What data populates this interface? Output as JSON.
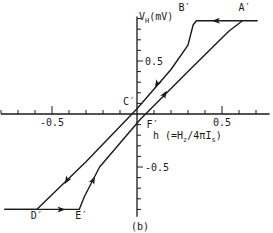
{
  "chart_data": {
    "type": "line",
    "title": "",
    "panel_label": "(b)",
    "xlabel": "h (=Hz/4πIs)",
    "xlabel_parts": {
      "main": "h (=H",
      "sub1": "z",
      "mid": "/4πI",
      "sub2": "s",
      "end": ")"
    },
    "ylabel": "VH(mV)",
    "ylabel_parts": {
      "main": "V",
      "sub": "H",
      "end": "(mV)"
    },
    "xlim": [
      -0.8,
      0.78
    ],
    "ylim": [
      -0.97,
      0.92
    ],
    "x_ticks_major": [
      -0.5,
      0.5
    ],
    "x_tick_labels": [
      "-0.5",
      "0.5"
    ],
    "x_tick_step": 0.1,
    "y_ticks_major": [
      0.5,
      -0.5
    ],
    "y_tick_labels": [
      "0.5",
      "-0.5"
    ],
    "y_tick_step": 0.1,
    "grid": false,
    "point_labels": [
      {
        "name": "A′",
        "x": 0.62,
        "y": 0.88
      },
      {
        "name": "B′",
        "x": 0.35,
        "y": 0.88
      },
      {
        "name": "C′",
        "x": 0.0,
        "y": 0.05
      },
      {
        "name": "D′",
        "x": -0.59,
        "y": -0.9
      },
      {
        "name": "E′",
        "x": -0.34,
        "y": -0.9
      },
      {
        "name": "F′",
        "x": 0.02,
        "y": -0.04
      }
    ],
    "series": [
      {
        "name": "descending branch (A′→B′→C′→D′)",
        "points": [
          [
            0.71,
            0.88
          ],
          [
            0.35,
            0.88
          ],
          [
            0.33,
            0.84
          ],
          [
            0.3,
            0.65
          ],
          [
            0.2,
            0.42
          ],
          [
            0.0,
            0.05
          ],
          [
            -0.3,
            -0.45
          ],
          [
            -0.59,
            -0.9
          ],
          [
            -0.78,
            -0.9
          ]
        ]
      },
      {
        "name": "ascending branch (D′→E′→F′→A′)",
        "points": [
          [
            -0.78,
            -0.9
          ],
          [
            -0.34,
            -0.9
          ],
          [
            -0.31,
            -0.78
          ],
          [
            -0.22,
            -0.5
          ],
          [
            0.02,
            -0.05
          ],
          [
            0.3,
            0.4
          ],
          [
            0.54,
            0.78
          ],
          [
            0.62,
            0.88
          ]
        ]
      }
    ]
  }
}
